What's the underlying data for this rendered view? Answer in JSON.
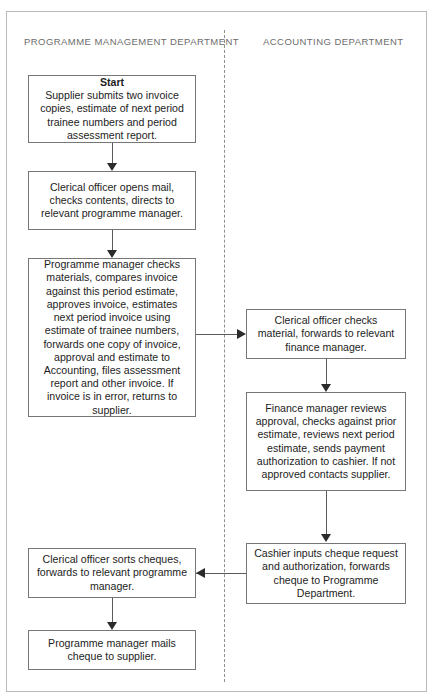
{
  "diagram": {
    "type": "flowchart",
    "orientation": "vertical-swimlane",
    "lanes": [
      {
        "id": "programme",
        "label": "PROGRAMME MANAGEMENT DEPARTMENT"
      },
      {
        "id": "accounting",
        "label": "ACCOUNTING DEPARTMENT"
      }
    ],
    "nodes": [
      {
        "id": "n1",
        "lane": "programme",
        "title": "Start",
        "text": "Supplier submits two invoice copies, estimate of next period trainee numbers and period assessment report."
      },
      {
        "id": "n2",
        "lane": "programme",
        "title": "",
        "text": "Clerical officer opens mail, checks contents, directs to relevant programme manager."
      },
      {
        "id": "n3",
        "lane": "programme",
        "title": "",
        "text": "Programme manager checks materials, compares invoice against this period estimate, approves invoice, estimates next period invoice using estimate of trainee numbers, forwards one copy of invoice, approval and estimate to Accounting, files assessment report and other invoice. If invoice is in error, returns to supplier."
      },
      {
        "id": "n4",
        "lane": "accounting",
        "title": "",
        "text": "Clerical officer checks material, forwards to relevant finance manager."
      },
      {
        "id": "n5",
        "lane": "accounting",
        "title": "",
        "text": "Finance manager reviews approval, checks against prior estimate, reviews next period estimate, sends payment authorization to cashier. If not approved contacts supplier."
      },
      {
        "id": "n6",
        "lane": "accounting",
        "title": "",
        "text": "Cashier inputs cheque request and authorization, forwards cheque to Programme Department."
      },
      {
        "id": "n7",
        "lane": "programme",
        "title": "",
        "text": "Clerical officer sorts cheques, forwards to relevant programme manager."
      },
      {
        "id": "n8",
        "lane": "programme",
        "title": "",
        "text": "Programme manager mails cheque to supplier."
      }
    ],
    "edges": [
      {
        "from": "n1",
        "to": "n2",
        "direction": "down"
      },
      {
        "from": "n2",
        "to": "n3",
        "direction": "down"
      },
      {
        "from": "n3",
        "to": "n4",
        "direction": "right"
      },
      {
        "from": "n4",
        "to": "n5",
        "direction": "down"
      },
      {
        "from": "n5",
        "to": "n6",
        "direction": "down"
      },
      {
        "from": "n6",
        "to": "n7",
        "direction": "left"
      },
      {
        "from": "n7",
        "to": "n8",
        "direction": "down"
      }
    ]
  },
  "colors": {
    "frame_border": "#b9b9b9",
    "node_border": "#767676",
    "connector": "#5a5a5a",
    "arrow": "#2b2b2b",
    "lane_label": "#6d6d6d",
    "node_text": "#1d1d1d",
    "background": "#ffffff"
  }
}
